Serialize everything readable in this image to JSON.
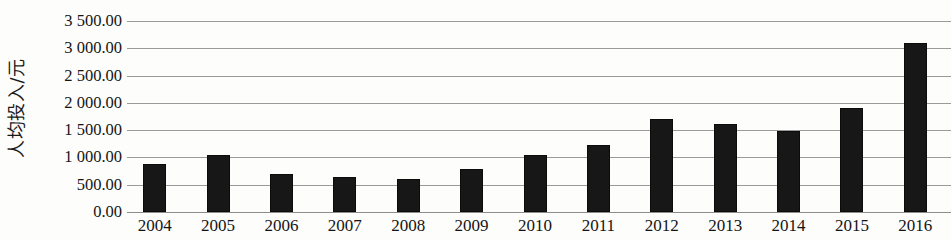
{
  "chart_data": {
    "type": "bar",
    "title": "",
    "xlabel": "",
    "ylabel": "人均投入/元",
    "categories": [
      "2004",
      "2005",
      "2006",
      "2007",
      "2008",
      "2009",
      "2010",
      "2011",
      "2012",
      "2013",
      "2014",
      "2015",
      "2016"
    ],
    "values": [
      880,
      1040,
      690,
      640,
      610,
      790,
      1050,
      1230,
      1710,
      1610,
      1490,
      1900,
      3100
    ],
    "ylim": [
      0,
      3500
    ],
    "ytick_values": [
      0,
      500,
      1000,
      1500,
      2000,
      2500,
      3000,
      3500
    ],
    "ytick_labels": [
      "0.00",
      "500.00",
      "1 000.00",
      "1 500.00",
      "2 000.00",
      "2 500.00",
      "3 000.00",
      "3 500.00"
    ],
    "grid": true,
    "legend": false,
    "bar_color": "#171717",
    "gridline_color": "#9a9a9a"
  }
}
